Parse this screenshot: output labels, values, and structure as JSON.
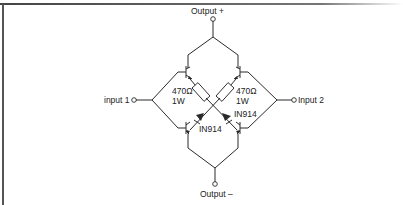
{
  "diagram": {
    "type": "circuit-schematic",
    "terminals": {
      "output_plus": "Output +",
      "output_minus": "Output –",
      "input1": "input 1",
      "input2": "Input 2"
    },
    "resistors": [
      {
        "value": "470Ω",
        "power": "1W"
      },
      {
        "value": "470Ω",
        "power": "1W"
      }
    ],
    "diodes": [
      {
        "part": "IN914"
      },
      {
        "part": "IN914"
      }
    ],
    "colors": {
      "line": "#2a2a2a",
      "background": "#ffffff",
      "border": "#555555"
    }
  }
}
